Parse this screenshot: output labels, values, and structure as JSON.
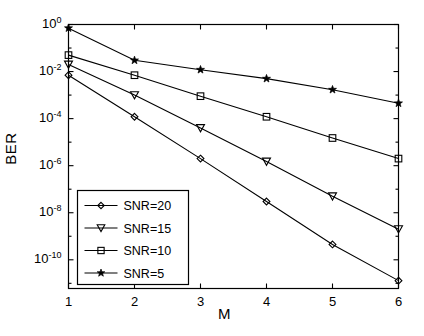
{
  "figure": {
    "background_color": "#ffffff",
    "line_color": "#000000",
    "axes": {
      "x_min": 1,
      "x_max": 6,
      "y_min_exp": -11.2,
      "y_max_exp": 0,
      "xlabel": "M",
      "ylabel": "BER",
      "x_ticks": [
        "1",
        "2",
        "3",
        "4",
        "5",
        "6"
      ],
      "y_ticks": [
        {
          "mantissa": "10",
          "exponent": "0"
        },
        {
          "mantissa": "10",
          "exponent": "-2"
        },
        {
          "mantissa": "10",
          "exponent": "-4"
        },
        {
          "mantissa": "10",
          "exponent": "-6"
        },
        {
          "mantissa": "10",
          "exponent": "-8"
        },
        {
          "mantissa": "10",
          "exponent": "-10"
        }
      ]
    },
    "legend": {
      "entries": [
        {
          "label": "SNR=20",
          "marker": "diamond-marker"
        },
        {
          "label": "SNR=15",
          "marker": "triangle-down-marker"
        },
        {
          "label": "SNR=10",
          "marker": "square-marker"
        },
        {
          "label": "SNR=5",
          "marker": "star-marker"
        }
      ]
    }
  },
  "chart_data": {
    "type": "line",
    "title": "",
    "xlabel": "M",
    "ylabel": "BER",
    "xlim": [
      1,
      6
    ],
    "ylim": [
      1e-11,
      1
    ],
    "yscale": "log",
    "xscale": "linear",
    "grid": false,
    "legend_position": "lower-left",
    "x": [
      1,
      2,
      3,
      4,
      5,
      6
    ],
    "series": [
      {
        "name": "SNR=20",
        "marker": "diamond",
        "values": [
          0.007,
          0.00012,
          2e-06,
          3e-08,
          4.5e-10,
          1.3e-11
        ]
      },
      {
        "name": "SNR=15",
        "marker": "triangle-down",
        "values": [
          0.02,
          0.001,
          4e-05,
          1.5e-06,
          5e-08,
          2e-09
        ]
      },
      {
        "name": "SNR=10",
        "marker": "square",
        "values": [
          0.05,
          0.007,
          0.0009,
          0.00012,
          1.5e-05,
          2e-06
        ]
      },
      {
        "name": "SNR=5",
        "marker": "star",
        "values": [
          0.7,
          0.03,
          0.012,
          0.005,
          0.0017,
          0.00045
        ]
      }
    ]
  }
}
